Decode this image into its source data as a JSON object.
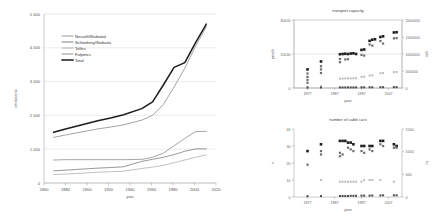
{
  "figure": {
    "background": "#ffffff",
    "panels": [
      "main-line-chart",
      "transport-capacity-chart",
      "number-of-cable-cars-chart"
    ]
  },
  "chart_data": [
    {
      "id": "main",
      "type": "line",
      "title": "",
      "xlabel": "year",
      "ylabel": "inhabitants",
      "xlim": [
        1860,
        2020
      ],
      "ylim": [
        0,
        5000
      ],
      "xticks": [
        1860,
        1880,
        1900,
        1920,
        1940,
        1960,
        1980,
        2000,
        2020
      ],
      "xticklabels": [
        "1860",
        "1880",
        "1900",
        "1920",
        "1940",
        "1960",
        "1980",
        "2000",
        "2020"
      ],
      "yticks": [
        0,
        1000,
        2000,
        3000,
        4000,
        5000
      ],
      "yticklabels": [
        "0",
        "1 000",
        "2 000",
        "3 000",
        "4 000",
        "5 000"
      ],
      "grid": true,
      "legend_position": "upper left",
      "legend_entries": [
        "Neustift/Stubaital",
        "Schönberg/Stubaita",
        "Telfes",
        "Fulpmes",
        "Total"
      ],
      "series": [
        {
          "name": "Neustift/Stubaital",
          "color": "#9a9a9a",
          "width": 0.9,
          "x": [
            1869,
            1880,
            1890,
            1900,
            1910,
            1923,
            1934,
            1951,
            1961,
            1971,
            1981,
            1991,
            2001,
            2011
          ],
          "values": [
            1350,
            1420,
            1480,
            1540,
            1600,
            1660,
            1720,
            1860,
            2000,
            2320,
            2840,
            3400,
            4050,
            4620
          ]
        },
        {
          "name": "Schönberg/Stubaita",
          "color": "#7d7d7d",
          "width": 0.8,
          "x": [
            1869,
            1880,
            1890,
            1900,
            1910,
            1923,
            1934,
            1951,
            1961,
            1971,
            1981,
            1991,
            2001,
            2011
          ],
          "values": [
            360,
            380,
            400,
            420,
            440,
            460,
            480,
            640,
            700,
            760,
            840,
            940,
            1010,
            1010
          ]
        },
        {
          "name": "Telfes",
          "color": "#b0b0b0",
          "width": 0.8,
          "x": [
            1869,
            1880,
            1890,
            1900,
            1910,
            1923,
            1934,
            1951,
            1961,
            1971,
            1981,
            1991,
            2001,
            2011
          ],
          "values": [
            250,
            265,
            280,
            300,
            320,
            335,
            350,
            430,
            470,
            520,
            600,
            680,
            760,
            830
          ]
        },
        {
          "name": "Fulpmes",
          "color": "#8f8f8f",
          "width": 0.8,
          "x": [
            1869,
            1880,
            1890,
            1900,
            1910,
            1923,
            1934,
            1951,
            1961,
            1971,
            1981,
            1991,
            2001,
            2011
          ],
          "values": [
            680,
            690,
            690,
            690,
            690,
            690,
            690,
            700,
            760,
            880,
            1100,
            1320,
            1520,
            1530
          ]
        },
        {
          "name": "Total",
          "color": "#1c1c1c",
          "width": 1.5,
          "x": [
            1869,
            1880,
            1890,
            1900,
            1910,
            1923,
            1934,
            1951,
            1961,
            1971,
            1981,
            1991,
            2001,
            2011
          ],
          "values": [
            1500,
            1600,
            1680,
            1760,
            1840,
            1930,
            2020,
            2200,
            2400,
            2900,
            3420,
            3560,
            4150,
            4700
          ]
        }
      ]
    },
    {
      "id": "transport-capacity",
      "type": "scatter",
      "title": "transport capacity",
      "xlabel": "year",
      "ylabel": "pers/h",
      "ylabel_right": "m/h",
      "xlim": [
        1972,
        2012
      ],
      "ylim": [
        0,
        30000
      ],
      "ylim_right": [
        0,
        2000000
      ],
      "xticks": [
        1977,
        1987,
        1997,
        2007
      ],
      "xticklabels": [
        "1977",
        "1987",
        "1997",
        "2007"
      ],
      "yticks": [
        0,
        15000,
        30000
      ],
      "yticklabels": [
        "0",
        "15000",
        "30000"
      ],
      "yticks_right": [
        0,
        500000,
        1000000,
        1500000,
        2000000
      ],
      "yticklabels_right": [
        "0",
        "500000",
        "1000000",
        "1500000",
        "2000000"
      ],
      "grid": true,
      "series": [
        {
          "name": "dark-squares",
          "color": "#1f1f1f",
          "marker": "square",
          "size": 2.6,
          "points": [
            [
              1977,
              8200
            ],
            [
              1982,
              11700
            ],
            [
              1989,
              14900
            ],
            [
              1990,
              15000
            ],
            [
              1991,
              15100
            ],
            [
              1992,
              15000
            ],
            [
              1993,
              15200
            ],
            [
              1994,
              15300
            ],
            [
              1995,
              15000
            ],
            [
              1997,
              16800
            ],
            [
              1998,
              17000
            ],
            [
              2000,
              20800
            ],
            [
              2001,
              21300
            ],
            [
              2002,
              21500
            ],
            [
              2004,
              22500
            ],
            [
              2005,
              22800
            ],
            [
              2009,
              24500
            ],
            [
              2010,
              24600
            ]
          ]
        },
        {
          "name": "mid-squares",
          "color": "#6e6e6e",
          "marker": "square",
          "size": 2.2,
          "points": [
            [
              1977,
              6400
            ],
            [
              1977,
              4900
            ],
            [
              1977,
              3600
            ],
            [
              1977,
              2300
            ],
            [
              1982,
              9600
            ],
            [
              1982,
              8200
            ],
            [
              1982,
              6600
            ],
            [
              1989,
              12800
            ],
            [
              1989,
              11400
            ],
            [
              1991,
              12600
            ],
            [
              1992,
              12700
            ],
            [
              1997,
              14600
            ],
            [
              1998,
              14300
            ],
            [
              2000,
              19200
            ],
            [
              2001,
              18700
            ],
            [
              2004,
              20700
            ],
            [
              2005,
              19600
            ],
            [
              2009,
              21900
            ],
            [
              2010,
              22000
            ]
          ]
        },
        {
          "name": "light-squares",
          "color": "#bdbdbd",
          "marker": "square",
          "size": 2.0,
          "points": [
            [
              1977,
              600
            ],
            [
              1982,
              800
            ],
            [
              1989,
              4100
            ],
            [
              1990,
              4150
            ],
            [
              1991,
              4200
            ],
            [
              1992,
              4200
            ],
            [
              1993,
              4250
            ],
            [
              1994,
              4300
            ],
            [
              1995,
              4300
            ],
            [
              1997,
              4900
            ],
            [
              1998,
              5000
            ],
            [
              2000,
              5500
            ],
            [
              2001,
              5600
            ],
            [
              2004,
              6500
            ],
            [
              2005,
              6600
            ],
            [
              2009,
              7000
            ],
            [
              2010,
              7050
            ]
          ]
        },
        {
          "name": "baseline-squares",
          "color": "#4a4a4a",
          "marker": "square",
          "size": 2.0,
          "points": [
            [
              1977,
              200
            ],
            [
              1982,
              220
            ],
            [
              1989,
              250
            ],
            [
              1990,
              250
            ],
            [
              1991,
              260
            ],
            [
              1992,
              260
            ],
            [
              1993,
              270
            ],
            [
              1994,
              270
            ],
            [
              1995,
              280
            ],
            [
              1997,
              300
            ],
            [
              1998,
              300
            ],
            [
              2000,
              320
            ],
            [
              2001,
              330
            ],
            [
              2004,
              350
            ],
            [
              2005,
              360
            ],
            [
              2009,
              380
            ],
            [
              2010,
              390
            ]
          ]
        }
      ]
    },
    {
      "id": "number-of-cable-cars",
      "type": "scatter",
      "title": "number of cable cars",
      "xlabel": "year",
      "ylabel": "n",
      "ylabel_right": "m",
      "xlim": [
        1972,
        2012
      ],
      "ylim": [
        0,
        40
      ],
      "ylim_right": [
        0,
        1500
      ],
      "xticks": [
        1977,
        1987,
        1997,
        2007
      ],
      "xticklabels": [
        "1977",
        "1987",
        "1997",
        "2007"
      ],
      "yticks": [
        0,
        10,
        20,
        30,
        40
      ],
      "yticklabels": [
        "0",
        "10",
        "20",
        "30",
        "40"
      ],
      "yticks_right": [
        0,
        500,
        1000,
        1500
      ],
      "yticklabels_right": [
        "0",
        "500",
        "1000",
        "1500"
      ],
      "grid": false,
      "series": [
        {
          "name": "dark-squares",
          "color": "#1f1f1f",
          "marker": "square",
          "size": 2.6,
          "points": [
            [
              1977,
              27
            ],
            [
              1982,
              31
            ],
            [
              1989,
              33
            ],
            [
              1990,
              33
            ],
            [
              1991,
              33
            ],
            [
              1992,
              32
            ],
            [
              1993,
              32
            ],
            [
              1994,
              31
            ],
            [
              1997,
              30
            ],
            [
              1998,
              30
            ],
            [
              2000,
              30
            ],
            [
              2001,
              30
            ],
            [
              2004,
              33
            ],
            [
              2005,
              33
            ],
            [
              2009,
              31
            ],
            [
              2010,
              30
            ]
          ]
        },
        {
          "name": "mid-squares",
          "color": "#6e6e6e",
          "marker": "square",
          "size": 2.2,
          "points": [
            [
              1977,
              19
            ],
            [
              1982,
              27
            ],
            [
              1982,
              25
            ],
            [
              1989,
              26
            ],
            [
              1989,
              24
            ],
            [
              1990,
              25
            ],
            [
              1992,
              29
            ],
            [
              1993,
              28
            ],
            [
              1994,
              27
            ],
            [
              1997,
              27
            ],
            [
              1998,
              26
            ],
            [
              2000,
              28
            ],
            [
              2001,
              27
            ],
            [
              2004,
              31
            ],
            [
              2005,
              30
            ],
            [
              2009,
              29
            ],
            [
              2010,
              29
            ]
          ]
        },
        {
          "name": "light-squares",
          "color": "#bdbdbd",
          "marker": "square",
          "size": 2.0,
          "points": [
            [
              1982,
              10
            ],
            [
              1989,
              9
            ],
            [
              1990,
              9
            ],
            [
              1991,
              9
            ],
            [
              1992,
              9
            ],
            [
              1993,
              9
            ],
            [
              1994,
              9
            ],
            [
              1995,
              9
            ],
            [
              1997,
              9
            ],
            [
              1998,
              10
            ],
            [
              2000,
              10
            ],
            [
              2001,
              10
            ],
            [
              2004,
              10
            ],
            [
              2009,
              9
            ]
          ]
        },
        {
          "name": "baseline-squares",
          "color": "#4a4a4a",
          "marker": "square",
          "size": 2.0,
          "points": [
            [
              1977,
              0.5
            ],
            [
              1982,
              0.5
            ],
            [
              1989,
              0.6
            ],
            [
              1990,
              0.6
            ],
            [
              1991,
              0.6
            ],
            [
              1992,
              0.6
            ],
            [
              1993,
              0.7
            ],
            [
              1994,
              0.7
            ],
            [
              1995,
              0.7
            ],
            [
              1997,
              0.8
            ],
            [
              1998,
              0.8
            ],
            [
              2000,
              0.8
            ],
            [
              2001,
              0.9
            ],
            [
              2004,
              0.9
            ],
            [
              2005,
              1.0
            ],
            [
              2009,
              1.0
            ],
            [
              2010,
              1.0
            ]
          ]
        }
      ]
    }
  ]
}
